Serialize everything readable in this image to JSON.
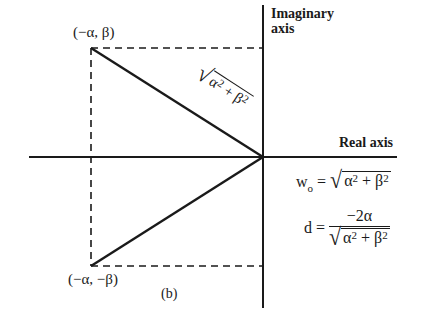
{
  "figure": {
    "caption": "(b)",
    "axes": {
      "real_label": "Real axis",
      "imaginary_label_line1": "Imaginary",
      "imaginary_label_line2": "axis"
    },
    "points": {
      "upper": "(−α, β)",
      "lower": "(−α, −β)"
    },
    "hypotenuse_label": {
      "surd": "√",
      "term1": "α",
      "exp1": "2",
      "plus": "+",
      "term2": "β",
      "exp2": "2"
    },
    "equations": {
      "w0": {
        "lhs": "w",
        "lhs_sub": "o",
        "eq": "=",
        "surd": "√",
        "a": "α",
        "a_exp": "2",
        "plus": "+",
        "b": "β",
        "b_exp": "2"
      },
      "d": {
        "lhs": "d",
        "eq": "=",
        "numerator": "−2α",
        "surd": "√",
        "a": "α",
        "a_exp": "2",
        "plus": "+",
        "b": "β",
        "b_exp": "2"
      }
    },
    "geometry": {
      "origin": [
        263,
        157
      ],
      "upper_vertex": [
        91,
        48
      ],
      "lower_vertex": [
        91,
        266
      ],
      "real_axis_x_range": [
        29,
        397
      ],
      "imag_axis_y_range": [
        5,
        308
      ]
    },
    "colors": {
      "ink": "#1a1a1a",
      "background": "#ffffff"
    }
  }
}
